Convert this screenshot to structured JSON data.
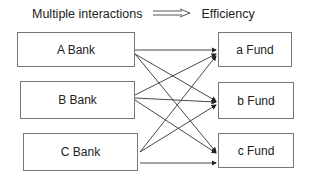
{
  "header": {
    "left_label": "Multiple interactions",
    "arrow_icon": "double-arrow-right",
    "right_label": "Efficiency"
  },
  "banks": [
    {
      "label": "A Bank"
    },
    {
      "label": "B Bank"
    },
    {
      "label": "C Bank"
    }
  ],
  "funds": [
    {
      "label": "a Fund"
    },
    {
      "label": "b Fund"
    },
    {
      "label": "c Fund"
    }
  ],
  "connections": [
    {
      "from": "A Bank",
      "to": "a Fund"
    },
    {
      "from": "A Bank",
      "to": "b Fund"
    },
    {
      "from": "A Bank",
      "to": "c Fund"
    },
    {
      "from": "B Bank",
      "to": "a Fund"
    },
    {
      "from": "B Bank",
      "to": "b Fund"
    },
    {
      "from": "B Bank",
      "to": "c Fund"
    },
    {
      "from": "C Bank",
      "to": "a Fund"
    },
    {
      "from": "C Bank",
      "to": "b Fund"
    },
    {
      "from": "C Bank",
      "to": "c Fund"
    }
  ],
  "colors": {
    "line": "#333333",
    "border": "#777777"
  }
}
